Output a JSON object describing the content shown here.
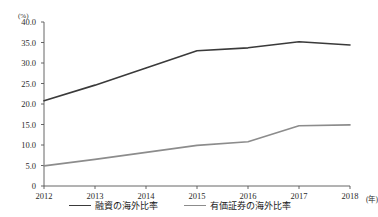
{
  "figure": {
    "top_note": "",
    "y_unit": "(%)",
    "x_unit": "(年)"
  },
  "axis_colors": {
    "axis": "#555555",
    "series_loan": "#3a3a3a",
    "series_securities": "#8c8c8c"
  },
  "chart_data": {
    "type": "line",
    "title": "",
    "xlabel": "(年)",
    "ylabel": "(%)",
    "x": [
      "2012",
      "2013",
      "2014",
      "2015",
      "2016",
      "2017",
      "2018"
    ],
    "categories": [
      "2012",
      "2013",
      "2014",
      "2015",
      "2016",
      "2017",
      "2018"
    ],
    "ylim": [
      0,
      40
    ],
    "ytick_labels": [
      "40.0",
      "35.0",
      "30.0",
      "25.0",
      "20.0",
      "15.0",
      "10.0",
      "5.0",
      "0"
    ],
    "ytick_values": [
      40,
      35,
      30,
      25,
      20,
      15,
      10,
      5,
      0
    ],
    "grid": false,
    "legend_position": "bottom",
    "series": [
      {
        "name": "融資の海外比率",
        "color": "#3a3a3a",
        "values": [
          20.8,
          24.6,
          28.8,
          33.0,
          33.7,
          35.2,
          34.4
        ]
      },
      {
        "name": "有価証券の海外比率",
        "color": "#8c8c8c",
        "values": [
          4.9,
          6.5,
          8.2,
          9.9,
          10.8,
          14.7,
          14.9
        ]
      }
    ]
  }
}
